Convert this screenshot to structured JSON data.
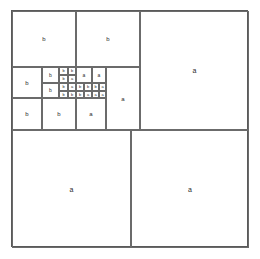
{
  "diagram": {
    "canvas": {
      "width": 260,
      "height": 259
    },
    "frame": {
      "x": 11,
      "y": 10,
      "width": 237,
      "height": 237
    },
    "stroke_color": "#6b6b6b",
    "frame_color": "#5a5a5a",
    "label_color": "#2b2b2b",
    "background_color": "#ffffff",
    "label_a": "a",
    "label_b": "b",
    "tiles": [
      {
        "id": "t01",
        "label": "a",
        "x": 128,
        "y": 0,
        "w": 109,
        "h": 119,
        "size": "lg"
      },
      {
        "id": "t02",
        "label": "a",
        "x": 0,
        "y": 119,
        "w": 119,
        "h": 118,
        "size": "lg"
      },
      {
        "id": "t03",
        "label": "a",
        "x": 119,
        "y": 119,
        "w": 118,
        "h": 118,
        "size": "lg"
      },
      {
        "id": "t04",
        "label": "b",
        "x": 0,
        "y": 0,
        "w": 64,
        "h": 56,
        "size": "md"
      },
      {
        "id": "t05",
        "label": "b",
        "x": 64,
        "y": 0,
        "w": 64,
        "h": 56,
        "size": "md"
      },
      {
        "id": "t06",
        "label": "a",
        "x": 94,
        "y": 56,
        "w": 34,
        "h": 63,
        "size": "md"
      },
      {
        "id": "t07",
        "label": "b",
        "x": 0,
        "y": 56,
        "w": 30,
        "h": 31,
        "size": "md"
      },
      {
        "id": "t08",
        "label": "b",
        "x": 0,
        "y": 87,
        "w": 30,
        "h": 32,
        "size": "md"
      },
      {
        "id": "t09",
        "label": "b",
        "x": 30,
        "y": 87,
        "w": 34,
        "h": 32,
        "size": "md"
      },
      {
        "id": "t10",
        "label": "a",
        "x": 64,
        "y": 87,
        "w": 30,
        "h": 32,
        "size": "md"
      },
      {
        "id": "t11",
        "label": "b",
        "x": 30,
        "y": 56,
        "w": 17,
        "h": 16,
        "size": "sm"
      },
      {
        "id": "t12",
        "label": "b",
        "x": 30,
        "y": 72,
        "w": 17,
        "h": 15,
        "size": "sm"
      },
      {
        "id": "t13",
        "label": "a",
        "x": 64,
        "y": 56,
        "w": 16,
        "h": 16,
        "size": "sm"
      },
      {
        "id": "t14",
        "label": "a",
        "x": 80,
        "y": 56,
        "w": 14,
        "h": 16,
        "size": "sm"
      },
      {
        "id": "t15",
        "label": "b",
        "x": 47,
        "y": 56,
        "w": 9,
        "h": 8,
        "size": "xs"
      },
      {
        "id": "t16",
        "label": "b",
        "x": 56,
        "y": 56,
        "w": 8,
        "h": 8,
        "size": "xs"
      },
      {
        "id": "t17",
        "label": "b",
        "x": 47,
        "y": 64,
        "w": 9,
        "h": 8,
        "size": "xs"
      },
      {
        "id": "t18",
        "label": "a",
        "x": 56,
        "y": 64,
        "w": 8,
        "h": 8,
        "size": "xs"
      },
      {
        "id": "t19",
        "label": "b",
        "x": 47,
        "y": 72,
        "w": 9,
        "h": 8,
        "size": "xs"
      },
      {
        "id": "t20",
        "label": "a",
        "x": 56,
        "y": 72,
        "w": 8,
        "h": 8,
        "size": "xs"
      },
      {
        "id": "t21",
        "label": "b",
        "x": 64,
        "y": 72,
        "w": 8,
        "h": 8,
        "size": "xs"
      },
      {
        "id": "t22",
        "label": "b",
        "x": 72,
        "y": 72,
        "w": 8,
        "h": 8,
        "size": "xs"
      },
      {
        "id": "t23",
        "label": "b",
        "x": 80,
        "y": 72,
        "w": 7,
        "h": 8,
        "size": "xs"
      },
      {
        "id": "t24",
        "label": "a",
        "x": 87,
        "y": 72,
        "w": 7,
        "h": 8,
        "size": "xs"
      },
      {
        "id": "t25",
        "label": "b",
        "x": 47,
        "y": 80,
        "w": 9,
        "h": 7,
        "size": "xs"
      },
      {
        "id": "t26",
        "label": "b",
        "x": 56,
        "y": 80,
        "w": 8,
        "h": 7,
        "size": "xs"
      },
      {
        "id": "t27",
        "label": "b",
        "x": 64,
        "y": 80,
        "w": 8,
        "h": 7,
        "size": "xs"
      },
      {
        "id": "t28",
        "label": "a",
        "x": 72,
        "y": 80,
        "w": 8,
        "h": 7,
        "size": "xs"
      },
      {
        "id": "t29",
        "label": "a",
        "x": 80,
        "y": 80,
        "w": 7,
        "h": 7,
        "size": "xs"
      },
      {
        "id": "t30",
        "label": "a",
        "x": 87,
        "y": 80,
        "w": 7,
        "h": 7,
        "size": "xs"
      },
      {
        "id": "t31",
        "label": "b",
        "x": 0,
        "y": 119,
        "w": 0,
        "h": 0,
        "size": "xs",
        "hidden": true
      }
    ],
    "bottom_band": [
      {
        "id": "b01",
        "label": "b",
        "x": 0,
        "y": 87,
        "w": 30,
        "h": 32,
        "size": "md"
      }
    ]
  }
}
